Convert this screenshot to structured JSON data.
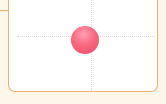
{
  "game": {
    "board": {
      "border_color": "#f0b070",
      "background": "#ffffff",
      "outer_background": "#fdf6ea",
      "guide_color": "#d8d8d8"
    },
    "ball": {
      "color": "#f8687f",
      "center_x": 84,
      "center_y": 40,
      "radius": 14
    },
    "crosshair": {
      "x": 91,
      "y": 37
    }
  }
}
